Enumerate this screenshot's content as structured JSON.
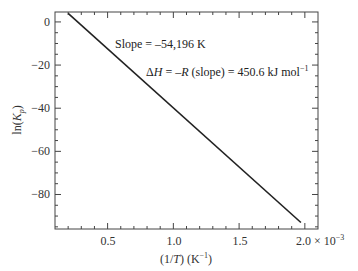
{
  "chart_data": {
    "type": "line",
    "title": "",
    "xlabel": "(1/T) (K⁻¹)",
    "ylabel": "ln(K_p)",
    "x_multiplier_label": "× 10⁻³",
    "xlim": [
      0.1,
      2.1
    ],
    "ylim": [
      -96,
      4.6
    ],
    "x_ticks": [
      0.5,
      1.0,
      1.5,
      2.0
    ],
    "x_tick_labels": [
      "0.5",
      "1.0",
      "1.5",
      "2.0 × 10⁻³"
    ],
    "y_ticks": [
      0,
      -20,
      -40,
      -60,
      -80
    ],
    "y_tick_labels": [
      "0",
      "−20",
      "−40",
      "−60",
      "−80"
    ],
    "grid": false,
    "legend": null,
    "series": [
      {
        "name": "ln(Kp) vs 1/T",
        "x": [
          0.2,
          1.97
        ],
        "y": [
          4.0,
          -93.0
        ],
        "color": "#222222"
      }
    ],
    "annotations": [
      "Slope = –54,196 K",
      "ΔH = –R (slope) = 450.6 kJ mol⁻¹"
    ]
  },
  "labels": {
    "xlabel_main": "(1/",
    "xlabel_T": "T",
    "xlabel_rest": ") (K",
    "xlabel_sup": "−1",
    "xlabel_close": ")",
    "ylabel_ln": "ln(",
    "ylabel_K": "K",
    "ylabel_sub": "p",
    "ylabel_close": ")",
    "slope": "Slope = –54,196 K",
    "dh_delta": "Δ",
    "dh_H": "H",
    "dh_mid": " = –",
    "dh_R": "R",
    "dh_rest": " (slope) = 450.6 kJ mol",
    "dh_sup": "−1",
    "x_tick_0": "0.5",
    "x_tick_1": "1.0",
    "x_tick_2": "1.5",
    "x_tick_3": "2.0 × 10",
    "x_tick_3_sup": "−3",
    "y_tick_0": "0",
    "y_tick_1": "−20",
    "y_tick_2": "−40",
    "y_tick_3": "−60",
    "y_tick_4": "−80"
  }
}
